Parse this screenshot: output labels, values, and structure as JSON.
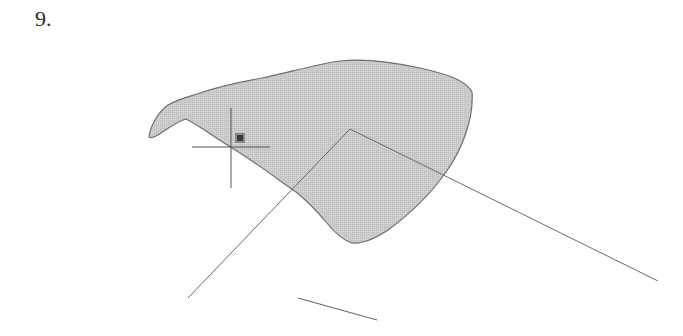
{
  "step": {
    "label": "9."
  },
  "drawing": {
    "region": {
      "fill": "#c8c8c8",
      "stroke": "#6e6e6e",
      "path": "M149,137 C150,128 156,114 168,105 C178,99 188,97 200,93 C220,86 240,82 262,78 C290,72 318,64 340,61 C366,58 392,62 420,68 C446,74 466,80 472,92 C474,118 462,150 446,172 C432,192 410,214 388,230 C376,238 364,244 352,243 C342,240 334,232 326,222 C316,210 306,200 296,192 C276,178 252,160 232,148 C214,137 200,126 186,119 C176,122 166,130 158,135 C154,137 150,139 149,137 Z"
    },
    "grip": {
      "x": 235,
      "y": 133,
      "size": 10,
      "fill": "#3a3a3a",
      "border": "#8a8a8a"
    },
    "crosshair": {
      "cx": 231,
      "cy": 147,
      "v": {
        "y1": 108,
        "y2": 188
      },
      "h": {
        "x1": 192,
        "x2": 270
      },
      "stroke": "#555555"
    },
    "lines": [
      {
        "name": "left-leg-line",
        "x1": 350,
        "y1": 129,
        "x2": 188,
        "y2": 298,
        "stroke": "#6a6a6a"
      },
      {
        "name": "right-leg-line",
        "x1": 350,
        "y1": 129,
        "x2": 658,
        "y2": 281,
        "stroke": "#6a6a6a"
      },
      {
        "name": "short-segment-line",
        "x1": 298,
        "y1": 298,
        "x2": 377,
        "y2": 320,
        "stroke": "#6a6a6a"
      }
    ]
  }
}
